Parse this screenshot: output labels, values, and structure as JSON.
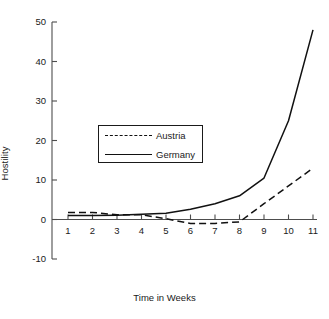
{
  "chart_data": {
    "type": "line",
    "title": "",
    "xlabel": "Time in Weeks",
    "ylabel": "Hostility",
    "x": [
      1,
      2,
      3,
      4,
      5,
      6,
      7,
      8,
      9,
      10,
      11
    ],
    "xticklabels": [
      "1",
      "2",
      "3",
      "4",
      "5",
      "6",
      "7",
      "8",
      "9",
      "10",
      "11"
    ],
    "yticks": [
      -10,
      0,
      10,
      20,
      30,
      40,
      50
    ],
    "yticklabels": [
      "-10",
      "0",
      "10",
      "20",
      "30",
      "40",
      "50"
    ],
    "xlim": [
      0,
      11.6
    ],
    "ylim": [
      -10,
      50
    ],
    "grid": false,
    "legend_position": "upper-center-left",
    "series": [
      {
        "name": "Austria",
        "style": "dashed",
        "color": "#111111",
        "values": [
          1.8,
          1.8,
          1.2,
          1.2,
          0.2,
          -1.0,
          -1.0,
          -0.6,
          4.0,
          8.5,
          13.0
        ]
      },
      {
        "name": "Germany",
        "style": "solid",
        "color": "#111111",
        "values": [
          1.0,
          1.0,
          1.1,
          1.3,
          1.6,
          2.6,
          4.0,
          6.0,
          10.5,
          25.0,
          48.0
        ]
      }
    ]
  },
  "axes": {
    "y_title": "Hostility",
    "x_title": "Time in Weeks"
  },
  "legend": {
    "entries": [
      {
        "label": "Austria",
        "style": "dashed"
      },
      {
        "label": "Germany",
        "style": "solid"
      }
    ]
  }
}
